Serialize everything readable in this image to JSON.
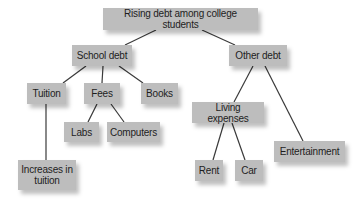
{
  "diagram": {
    "type": "tree",
    "root": "Rising debt among college students",
    "nodes": {
      "root": "Rising debt among college students",
      "school_debt": "School debt",
      "other_debt": "Other debt",
      "tuition": "Tuition",
      "fees": "Fees",
      "books": "Books",
      "labs": "Labs",
      "computers": "Computers",
      "increases_in_tuition": "Increases in tuition",
      "living_expenses": "Living expenses",
      "rent": "Rent",
      "car": "Car",
      "entertainment": "Entertainment"
    },
    "edges": [
      [
        "root",
        "school_debt"
      ],
      [
        "root",
        "other_debt"
      ],
      [
        "school_debt",
        "tuition"
      ],
      [
        "school_debt",
        "fees"
      ],
      [
        "school_debt",
        "books"
      ],
      [
        "fees",
        "labs"
      ],
      [
        "fees",
        "computers"
      ],
      [
        "tuition",
        "increases_in_tuition"
      ],
      [
        "other_debt",
        "living_expenses"
      ],
      [
        "other_debt",
        "entertainment"
      ],
      [
        "living_expenses",
        "rent"
      ],
      [
        "living_expenses",
        "car"
      ]
    ],
    "colors": {
      "node_fill": "#bdbdbd",
      "text": "#1e1e1e",
      "connector": "#3a3a3a",
      "background": "#ffffff"
    }
  }
}
